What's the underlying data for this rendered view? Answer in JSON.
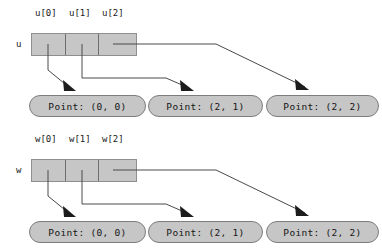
{
  "figure": {
    "background_color": "#ffffff",
    "cell_fill_color": "#c6c6c6",
    "cell_border_color": "#8e8e8e",
    "pill_fill_color": "#c6c6c6",
    "pill_border_color": "#7d7d7d",
    "connector_color": "#4a4a4a",
    "arrowhead_color": "#1c1c1c"
  },
  "groups": [
    {
      "var_label": "u",
      "index_labels": [
        "u[0]",
        "u[1]",
        "u[2]"
      ],
      "targets": [
        "Point: (0, 0)",
        "Point: (2, 1)",
        "Point: (2, 2)"
      ]
    },
    {
      "var_label": "w",
      "index_labels": [
        "w[0]",
        "w[1]",
        "w[2]"
      ],
      "targets": [
        "Point: (0, 0)",
        "Point: (2, 1)",
        "Point: (2, 2)"
      ]
    }
  ]
}
